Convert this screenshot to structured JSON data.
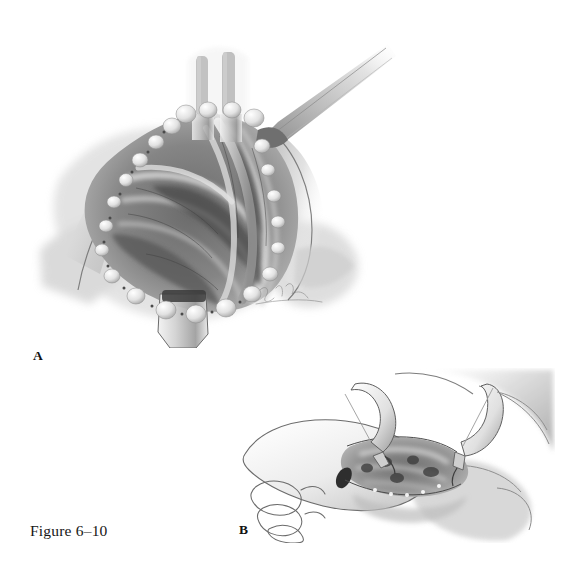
{
  "figure": {
    "caption": "Figure 6–10",
    "medium": "grayscale pencil-and-wash surgical illustration",
    "background_color": "#ffffff",
    "ink_color": "#161616",
    "artist_signature_present": true
  },
  "panels": [
    {
      "id": "A",
      "label": "A",
      "label_position": {
        "x": 33,
        "y": 348
      },
      "subject": "volar forearm / wrist surgical exposure held open by retractors and skin retention sutures",
      "elements": [
        "two dark retractor blades at superior margin",
        "long retractor handle extending to upper right",
        "skin edges everted with suture knots along both wound margins",
        "exposed tendons, nerve and vessels in the wound bed",
        "inferior retractor blade at the bottom of the wound",
        "artist signature at lower right of the wound"
      ]
    },
    {
      "id": "B",
      "label": "B",
      "label_position": {
        "x": 239,
        "y": 522
      },
      "subject": "hand and wrist with a short incision spread by two rake retractors",
      "elements": [
        "flexed fingers outlined at left",
        "two self-retaining rake retractors opening the incision",
        "small exposed operative field between the retractors",
        "thenar eminence and forearm shaded at right"
      ]
    }
  ],
  "colors": {
    "paper": "#ffffff",
    "text": "#161616",
    "wash_dark": "#4a4a4a",
    "wash_mid": "#8d8d8d",
    "wash_light": "#c9c9c9",
    "outline": "#5a5a5a"
  }
}
